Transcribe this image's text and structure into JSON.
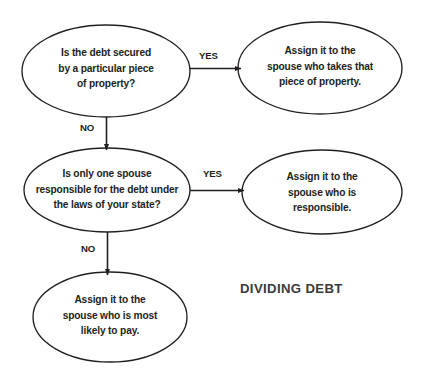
{
  "diagram": {
    "title": "DIVIDING DEBT",
    "colors": {
      "background": "#ffffff",
      "stroke": "#231f20",
      "text": "#231f20",
      "title": "#3b3b3b"
    },
    "nodes": [
      {
        "id": "q1",
        "kind": "decision",
        "text": "Is the debt secured\nby a particular piece\nof property?"
      },
      {
        "id": "a1",
        "kind": "outcome",
        "text": "Assign it to the\nspouse who takes that\npiece of property."
      },
      {
        "id": "q2",
        "kind": "decision",
        "text": "Is only one spouse\nresponsible for the debt under\nthe laws of your state?"
      },
      {
        "id": "a2",
        "kind": "outcome",
        "text": "Assign it to the\nspouse who is\nresponsible."
      },
      {
        "id": "a3",
        "kind": "outcome",
        "text": "Assign it to the\nspouse who is most\nlikely to pay."
      }
    ],
    "edges": [
      {
        "id": "e1",
        "from": "q1",
        "to": "a1",
        "label": "YES",
        "direction": "right"
      },
      {
        "id": "e2",
        "from": "q1",
        "to": "q2",
        "label": "NO",
        "direction": "down"
      },
      {
        "id": "e3",
        "from": "q2",
        "to": "a2",
        "label": "YES",
        "direction": "right"
      },
      {
        "id": "e4",
        "from": "q2",
        "to": "a3",
        "label": "NO",
        "direction": "down"
      }
    ]
  }
}
